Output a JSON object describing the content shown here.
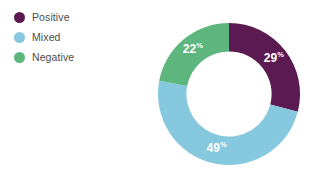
{
  "chart_data": {
    "type": "pie",
    "variant": "donut",
    "title": "",
    "subtitle": "",
    "xlabel": "",
    "ylabel": "",
    "grid": false,
    "legend_position": "top-left",
    "value_suffix": "%",
    "start_angle_deg": 0,
    "direction": "clockwise",
    "inner_radius_ratio": 0.6,
    "categories": [
      "Positive",
      "Mixed",
      "Negative"
    ],
    "values": [
      29,
      49,
      22
    ],
    "labels": [
      "29",
      "49",
      "22"
    ],
    "colors": [
      "#5C1A52",
      "#86C8DE",
      "#5CB67E"
    ],
    "series": [
      {
        "name": "Sentiment share",
        "values": [
          29,
          49,
          22
        ]
      }
    ],
    "slices": [
      {
        "name": "Positive",
        "value": 29,
        "label": "29",
        "suffix": "%",
        "color": "#5C1A52",
        "label_color": "#ffffff"
      },
      {
        "name": "Mixed",
        "value": 49,
        "label": "49",
        "suffix": "%",
        "color": "#86C8DE",
        "label_color": "#ffffff"
      },
      {
        "name": "Negative",
        "value": 22,
        "label": "22",
        "suffix": "%",
        "color": "#5CB67E",
        "label_color": "#ffffff"
      }
    ]
  },
  "legend": {
    "items": [
      {
        "label": "Positive",
        "color": "#5C1A52"
      },
      {
        "label": "Mixed",
        "color": "#86C8DE"
      },
      {
        "label": "Negative",
        "color": "#5CB67E"
      }
    ]
  },
  "theme": {
    "background": "#ffffff",
    "legend_text": "#4c4c4c",
    "label_text": "#ffffff"
  }
}
